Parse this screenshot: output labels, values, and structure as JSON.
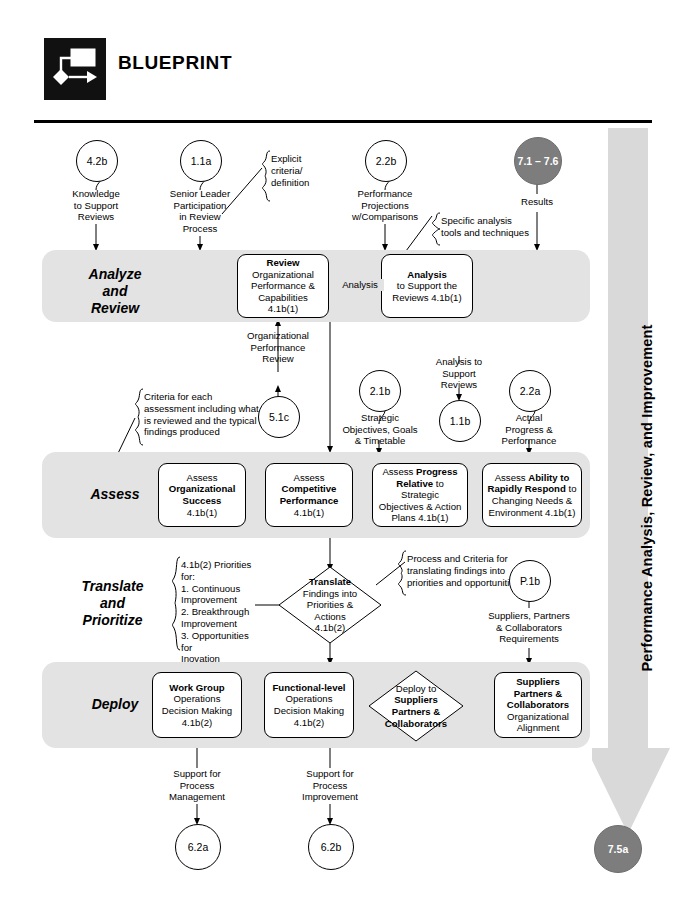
{
  "header": {
    "brand": "BLUEPRINT",
    "logo_icon": "flowchart-logo-icon"
  },
  "vertical_arrow": {
    "label": "Performance Analysis, Review, and Improvement",
    "color": "#d9d9d9"
  },
  "bands": [
    {
      "id": "analyze",
      "label": "Analyze\nand\nReview"
    },
    {
      "id": "assess",
      "label": "Assess"
    },
    {
      "id": "translate",
      "label": "Translate\nand\nPrioritize"
    },
    {
      "id": "deploy",
      "label": "Deploy"
    }
  ],
  "band_labels": {
    "analyze_l1": "Analyze",
    "analyze_l2": "and",
    "analyze_l3": "Review",
    "assess": "Assess",
    "translate_l1": "Translate",
    "translate_l2": "and",
    "translate_l3": "Prioritize",
    "deploy": "Deploy"
  },
  "circles": {
    "c_42b": "4.2b",
    "c_11a": "1.1a",
    "c_22b": "2.2b",
    "c_71_76": "7.1 – 7.6",
    "c_51c": "5.1c",
    "c_21b": "2.1b",
    "c_11b": "1.1b",
    "c_22a": "2.2a",
    "c_p1b": "P.1b",
    "c_62a": "6.2a",
    "c_62b": "6.2b",
    "c_75a": "7.5a"
  },
  "connector_labels": {
    "knowledge_to_support": "Knowledge\nto Support\nReviews",
    "senior_leader": "Senior Leader\nParticipation\nin Review\nProcess",
    "performance_projections": "Performance\nProjections\nw/Comparisons",
    "results": "Results",
    "analysis": "Analysis",
    "org_performance_review": "Organizational\nPerformance\nReview",
    "analysis_to_support_reviews": "Analysis to\nSupport\nReviews",
    "strategic_objectives": "Strategic\nObjectives, Goals\n& Timetable",
    "actual_progress": "Actual\nProgress &\nPerformance",
    "suppliers_requirements": "Suppliers, Partners\n& Collaborators\nRequirements",
    "support_process_management": "Support for\nProcess\nManagement",
    "support_process_improvement": "Support for\nProcess\nImprovement"
  },
  "connector_lines": {
    "knowledge_l1": "Knowledge",
    "knowledge_l2": "to Support",
    "knowledge_l3": "Reviews",
    "senior_l1": "Senior Leader",
    "senior_l2": "Participation",
    "senior_l3": "in Review",
    "senior_l4": "Process",
    "perfproj_l1": "Performance",
    "perfproj_l2": "Projections",
    "perfproj_l3": "w/Comparisons",
    "results_l1": "Results",
    "analysis_mid": "Analysis",
    "opr_l1": "Organizational",
    "opr_l2": "Performance",
    "opr_l3": "Review",
    "atsr_l1": "Analysis to",
    "atsr_l2": "Support",
    "atsr_l3": "Reviews",
    "strat_l1": "Strategic",
    "strat_l2": "Objectives, Goals",
    "strat_l3": "& Timetable",
    "actual_l1": "Actual",
    "actual_l2": "Progress &",
    "actual_l3": "Performance",
    "supreq_l1": "Suppliers, Partners",
    "supreq_l2": "& Collaborators",
    "supreq_l3": "Requirements",
    "spm_l1": "Support for",
    "spm_l2": "Process",
    "spm_l3": "Management",
    "spi_l1": "Support for",
    "spi_l2": "Process",
    "spi_l3": "Improvement"
  },
  "callouts": {
    "explicit": {
      "l1": "Explicit",
      "l2": "criteria/",
      "l3": "definition"
    },
    "specific_tools": {
      "l1": "Specific analysis",
      "l2": "tools and techniques"
    },
    "criteria_assessment": {
      "l1": "Criteria for each",
      "l2": "assessment including what",
      "l3": "is reviewed and the typical",
      "l4": "findings produced"
    },
    "priorities": {
      "l1": "4.1b(2) Priorities for:",
      "l2": "1. Continuous",
      "l3": "Improvement",
      "l4": "2. Breakthrough",
      "l5": "Improvement",
      "l6": "3. Opportunities for",
      "l7": "Inovation"
    },
    "process_criteria": {
      "l1": "Process and Criteria for",
      "l2": "translating findings into",
      "l3": "priorities and opportunities"
    }
  },
  "boxes": {
    "review": {
      "l1": "Review",
      "l2": "Organizational",
      "l3": "Performance &",
      "l4": "Capabilities",
      "l5": "4.1b(1)"
    },
    "analysis_support": {
      "l1": "Analysis",
      "l2": "to Support the",
      "l3": "Reviews 4.1b(1)"
    },
    "assess_org": {
      "l1": "Assess",
      "l2": "Organizational",
      "l3": "Success",
      "l4": "4.1b(1)"
    },
    "assess_comp": {
      "l1": "Assess",
      "l2": "Competitive",
      "l3": "Performance",
      "l4": "4.1b(1)"
    },
    "assess_progress": {
      "l1a": "Assess ",
      "l1b": "Progress",
      "l2a": "Relative",
      "l2b": " to Strategic",
      "l3": "Objectives & Action",
      "l4": "Plans 4.1b(1)"
    },
    "assess_ability": {
      "l1a": "Assess ",
      "l1b": "Ability to",
      "l2a": "Rapidly Respond",
      "l2b": " to",
      "l3": "Changing Needs &",
      "l4": "Environment 4.1b(1)"
    },
    "translate_diamond": {
      "l1": "Translate",
      "l2": "Findings into",
      "l3": "Priorities &",
      "l4": "Actions",
      "l5": "4.1b(2)"
    },
    "work_group": {
      "l1": "Work Group",
      "l2": "Operations",
      "l3": "Decision Making",
      "l4": "4.1b(2)"
    },
    "functional_level": {
      "l1": "Functional-level",
      "l2": "Operations",
      "l3": "Decision Making",
      "l4": "4.1b(2)"
    },
    "deploy_diamond": {
      "l1": "Deploy to",
      "l2": "Suppliers",
      "l3": "Partners &",
      "l4": "Collaborators"
    },
    "suppliers_box": {
      "l1": "Suppliers",
      "l2": "Partners &",
      "l3": "Collaborators",
      "l4": "Organizational",
      "l5": "Alignment"
    }
  }
}
